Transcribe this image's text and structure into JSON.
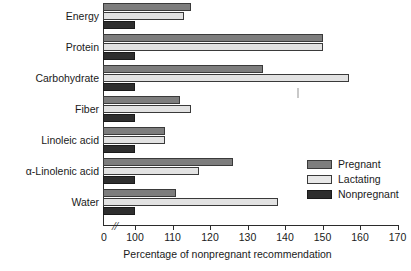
{
  "chart_data": {
    "type": "bar",
    "orientation": "horizontal",
    "title": "",
    "xlabel": "Percentage of nonpregnant recommendation",
    "ylabel": "",
    "categories": [
      "Energy",
      "Protein",
      "Carbohydrate",
      "Fiber",
      "Linoleic acid",
      "α-Linolenic acid",
      "Water"
    ],
    "series": [
      {
        "name": "Pregnant",
        "color": "#7d7d7d",
        "values": [
          115,
          150,
          134,
          112,
          108,
          126,
          111
        ]
      },
      {
        "name": "Lactating",
        "color": "#e2e2e2",
        "values": [
          113,
          150,
          157,
          115,
          108,
          117,
          138
        ]
      },
      {
        "name": "Nonpregnant",
        "color": "#2e2e2e",
        "values": [
          100,
          100,
          100,
          100,
          100,
          100,
          100
        ]
      }
    ],
    "xlim": [
      100,
      170
    ],
    "xticks": [
      0,
      100,
      110,
      120,
      130,
      140,
      150,
      160,
      170
    ],
    "xtick_labels": [
      "0",
      "100",
      "110",
      "120",
      "130",
      "140",
      "150",
      "160",
      "170"
    ],
    "axis_break": true,
    "axis_break_symbol": "//",
    "grid": false,
    "legend_position": "middle-right"
  },
  "axis": {
    "x_title": "Percentage of nonpregnant recommendation",
    "ticks": [
      {
        "label": "0",
        "x": 104
      },
      {
        "label": "100",
        "x": 135
      },
      {
        "label": "110",
        "x": 172.5
      },
      {
        "label": "120",
        "x": 210
      },
      {
        "label": "130",
        "x": 247.5
      },
      {
        "label": "140",
        "x": 285
      },
      {
        "label": "150",
        "x": 322.5
      },
      {
        "label": "160",
        "x": 360
      },
      {
        "label": "170",
        "x": 397.5
      }
    ],
    "break_symbol": "//"
  },
  "categories": [
    {
      "label": "Energy",
      "top": 3,
      "pregnant": 115,
      "lactating": 113,
      "nonpregnant": 100
    },
    {
      "label": "Protein",
      "top": 34,
      "pregnant": 150,
      "lactating": 150,
      "nonpregnant": 100
    },
    {
      "label": "Carbohydrate",
      "top": 65,
      "pregnant": 134,
      "lactating": 157,
      "nonpregnant": 100
    },
    {
      "label": "Fiber",
      "top": 96,
      "pregnant": 112,
      "lactating": 115,
      "nonpregnant": 100
    },
    {
      "label": "Linoleic acid",
      "top": 127,
      "pregnant": 108,
      "lactating": 108,
      "nonpregnant": 100
    },
    {
      "label": "α-Linolenic acid",
      "top": 158,
      "pregnant": 126,
      "lactating": 117,
      "nonpregnant": 100
    },
    {
      "label": "Water",
      "top": 189,
      "pregnant": 111,
      "lactating": 138,
      "nonpregnant": 100
    }
  ],
  "legend": {
    "items": [
      {
        "label": "Pregnant",
        "swatch": "pregnant",
        "color": "#7d7d7d"
      },
      {
        "label": "Lactating",
        "swatch": "lactating",
        "color": "#e8e8e8"
      },
      {
        "label": "Nonpregnant",
        "swatch": "nonpregnant",
        "color": "#2e2e2e"
      }
    ]
  }
}
